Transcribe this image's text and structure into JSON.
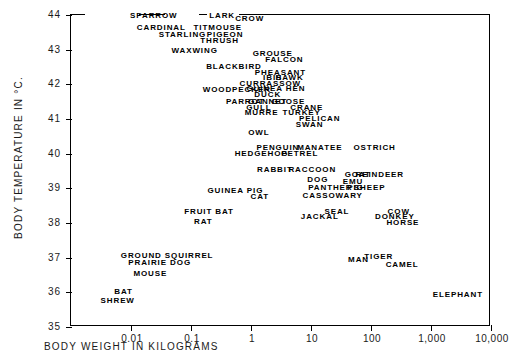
{
  "chart_data": {
    "type": "scatter",
    "title": "",
    "xlabel": "BODY WEIGHT IN KILOGRAMS",
    "ylabel": "BODY TEMPERATURE IN °C.",
    "xscale": "log",
    "xlim": [
      0.003,
      10000
    ],
    "ylim": [
      35,
      44
    ],
    "grid": false,
    "legend": null,
    "xticks": [
      "0.01",
      "0.1",
      "1",
      "10",
      "100",
      "1,000",
      "10,000"
    ],
    "xtick_values": [
      0.01,
      0.1,
      1,
      10,
      100,
      1000,
      10000
    ],
    "yticks": [
      "44",
      "43",
      "42",
      "41",
      "40",
      "39",
      "38",
      "37",
      "36",
      "35"
    ],
    "ytick_values": [
      44,
      43,
      42,
      41,
      40,
      39,
      38,
      37,
      36,
      35
    ],
    "marker_style": "text-label",
    "points": [
      {
        "label": "SPARROW",
        "x": 0.024,
        "y": 44.0
      },
      {
        "label": "LARK",
        "x": 0.33,
        "y": 44.0
      },
      {
        "label": "CROW",
        "x": 0.95,
        "y": 43.9
      },
      {
        "label": "CARDINAL",
        "x": 0.032,
        "y": 43.65
      },
      {
        "label": "TITMOUSE",
        "x": 0.28,
        "y": 43.65
      },
      {
        "label": "STARLING",
        "x": 0.072,
        "y": 43.45
      },
      {
        "label": "PIGEON",
        "x": 0.37,
        "y": 43.45
      },
      {
        "label": "THRUSH",
        "x": 0.3,
        "y": 43.28
      },
      {
        "label": "WAXWING",
        "x": 0.115,
        "y": 43.0
      },
      {
        "label": "GROUSE",
        "x": 2.3,
        "y": 42.9
      },
      {
        "label": "FALCON",
        "x": 3.6,
        "y": 42.72
      },
      {
        "label": "BLACKBIRD",
        "x": 0.52,
        "y": 42.52
      },
      {
        "label": "PHEASANT",
        "x": 3.1,
        "y": 42.35
      },
      {
        "label": "IBIS",
        "x": 2.3,
        "y": 42.2
      },
      {
        "label": "HAWK",
        "x": 4.4,
        "y": 42.2
      },
      {
        "label": "CURRASSOW",
        "x": 2.1,
        "y": 42.03
      },
      {
        "label": "WOODPECKER",
        "x": 0.58,
        "y": 41.87
      },
      {
        "label": "GUINEA HEN",
        "x": 2.6,
        "y": 41.9
      },
      {
        "label": "DUCK",
        "x": 1.9,
        "y": 41.73
      },
      {
        "label": "PARROT",
        "x": 0.8,
        "y": 41.52
      },
      {
        "label": "GANNET",
        "x": 1.9,
        "y": 41.52
      },
      {
        "label": "GOOSE",
        "x": 4.2,
        "y": 41.52
      },
      {
        "label": "GULL",
        "x": 1.35,
        "y": 41.35
      },
      {
        "label": "CRANE",
        "x": 8.5,
        "y": 41.35
      },
      {
        "label": "MURRE",
        "x": 1.5,
        "y": 41.2
      },
      {
        "label": "TURKEY",
        "x": 7.0,
        "y": 41.2
      },
      {
        "label": "PELICAN",
        "x": 14.0,
        "y": 41.03
      },
      {
        "label": "SWAN",
        "x": 9.5,
        "y": 40.87
      },
      {
        "label": "OWL",
        "x": 1.35,
        "y": 40.62
      },
      {
        "label": "PENGUIN",
        "x": 2.8,
        "y": 40.2
      },
      {
        "label": "MANATEE",
        "x": 14.0,
        "y": 40.2
      },
      {
        "label": "OSTRICH",
        "x": 115.0,
        "y": 40.2
      },
      {
        "label": "HEDGEHOG",
        "x": 1.5,
        "y": 40.03
      },
      {
        "label": "PETREL",
        "x": 6.5,
        "y": 40.03
      },
      {
        "label": "RABBIT",
        "x": 2.5,
        "y": 39.55
      },
      {
        "label": "RACCOON",
        "x": 10.5,
        "y": 39.55
      },
      {
        "label": "GOAT",
        "x": 60.0,
        "y": 39.4
      },
      {
        "label": "REINDEER",
        "x": 140.0,
        "y": 39.4
      },
      {
        "label": "DOG",
        "x": 13.0,
        "y": 39.28
      },
      {
        "label": "EMU",
        "x": 50.0,
        "y": 39.2
      },
      {
        "label": "PANTHER",
        "x": 21.0,
        "y": 39.03
      },
      {
        "label": "PIG",
        "x": 55.0,
        "y": 39.05
      },
      {
        "label": "SHEEP",
        "x": 95.0,
        "y": 39.05
      },
      {
        "label": "GUINEA PIG",
        "x": 0.55,
        "y": 38.95
      },
      {
        "label": "CAT",
        "x": 1.4,
        "y": 38.78
      },
      {
        "label": "CASSOWARY",
        "x": 23.0,
        "y": 38.82
      },
      {
        "label": "FRUIT BAT",
        "x": 0.2,
        "y": 38.35
      },
      {
        "label": "SEAL",
        "x": 27.0,
        "y": 38.35
      },
      {
        "label": "COW",
        "x": 290.0,
        "y": 38.35
      },
      {
        "label": "JACKAL",
        "x": 14.0,
        "y": 38.2
      },
      {
        "label": "DONKEY",
        "x": 250.0,
        "y": 38.2
      },
      {
        "label": "RAT",
        "x": 0.16,
        "y": 38.05
      },
      {
        "label": "HORSE",
        "x": 340.0,
        "y": 38.03
      },
      {
        "label": "GROUND SQUIRREL",
        "x": 0.04,
        "y": 37.07
      },
      {
        "label": "MAN",
        "x": 62.0,
        "y": 36.95
      },
      {
        "label": "TIGER",
        "x": 135.0,
        "y": 37.05
      },
      {
        "label": "PRAIRIE DOG",
        "x": 0.03,
        "y": 36.87
      },
      {
        "label": "CAMEL",
        "x": 330.0,
        "y": 36.83
      },
      {
        "label": "MOUSE",
        "x": 0.021,
        "y": 36.55
      },
      {
        "label": "BAT",
        "x": 0.0075,
        "y": 36.05
      },
      {
        "label": "ELEPHANT",
        "x": 2800.0,
        "y": 35.95
      },
      {
        "label": "SHREW",
        "x": 0.006,
        "y": 35.78
      }
    ]
  }
}
